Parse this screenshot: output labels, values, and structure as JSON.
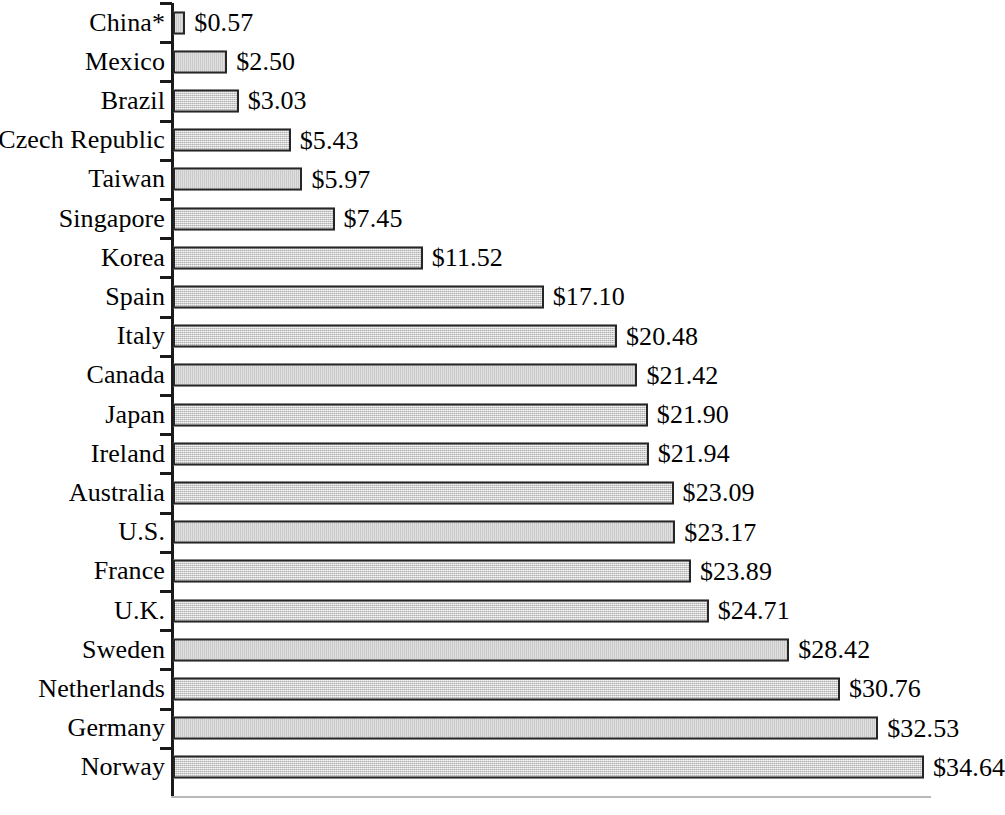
{
  "chart_data": {
    "type": "bar",
    "orientation": "horizontal",
    "title": "",
    "subtitle": "",
    "xlabel": "",
    "ylabel": "",
    "xlim": [
      0,
      34.64
    ],
    "grid": false,
    "legend": null,
    "value_prefix": "$",
    "categories": [
      "China*",
      "Mexico",
      "Brazil",
      "Czech Republic",
      "Taiwan",
      "Singapore",
      "Korea",
      "Spain",
      "Italy",
      "Canada",
      "Japan",
      "Ireland",
      "Australia",
      "U.S.",
      "France",
      "U.K.",
      "Sweden",
      "Netherlands",
      "Germany",
      "Norway"
    ],
    "values": [
      0.57,
      2.5,
      3.03,
      5.43,
      5.97,
      7.45,
      11.52,
      17.1,
      20.48,
      21.42,
      21.9,
      21.94,
      23.09,
      23.17,
      23.89,
      24.71,
      28.42,
      30.76,
      32.53,
      34.64
    ],
    "value_labels": [
      "$0.57",
      "$2.50",
      "$3.03",
      "$5.43",
      "$5.97",
      "$7.45",
      "$11.52",
      "$17.10",
      "$20.48",
      "$21.42",
      "$21.90",
      "$21.94",
      "$23.09",
      "$23.17",
      "$23.89",
      "$24.71",
      "$28.42",
      "$30.76",
      "$32.53",
      "$34.64"
    ],
    "bar_fill_color": "#d3d3d3",
    "bar_border_color": "#262626",
    "axis_color": "#1a1a1a",
    "baseline_color": "#b9b9b9",
    "text_color": "#000000",
    "footnote_marker": "*"
  }
}
